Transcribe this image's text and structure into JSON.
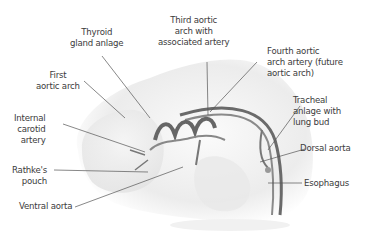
{
  "figure": {
    "type": "anatomical illustration"
  },
  "labels": {
    "thyroid": "Thyroid\ngland anlage",
    "third_arch": "Third aortic\narch with\nassociated artery",
    "fourth_arch": "Fourth aortic\narch artery (future\naortic arch)",
    "first_arch": "First\naortic arch",
    "tracheal": "Tracheal\nanlage with\nlung bud",
    "internal_carotid": "Internal\ncarotid\nartery",
    "dorsal_aorta": "Dorsal aorta",
    "rathke": "Rathke's\npouch",
    "esophagus": "Esophagus",
    "ventral_aorta": "Ventral aorta"
  },
  "colors": {
    "text": "#3b3b3b",
    "leader": "#555555",
    "body": "#efefef",
    "vessel": "#6a6a6a"
  }
}
